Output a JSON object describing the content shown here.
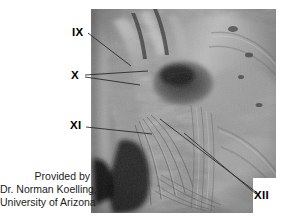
{
  "figure": {
    "type": "anatomical-dissection-photograph",
    "photo": {
      "tone": "grayscale",
      "left": 91,
      "top": 9,
      "width": 185,
      "height": 204
    }
  },
  "labels": [
    {
      "id": "ix",
      "text": "IX",
      "x": 72,
      "y": 27,
      "leaders": [
        [
          88,
          33,
          131,
          66
        ]
      ]
    },
    {
      "id": "x",
      "text": "X",
      "x": 71,
      "y": 70,
      "leaders": [
        [
          85,
          76,
          148,
          71
        ],
        [
          85,
          77,
          140,
          84
        ]
      ]
    },
    {
      "id": "xi",
      "text": "XI",
      "x": 70,
      "y": 120,
      "leaders": [
        [
          86,
          127,
          152,
          134
        ]
      ]
    },
    {
      "id": "xii",
      "text": "XII",
      "x": 254,
      "y": 190,
      "leaders": [
        [
          160,
          119,
          256,
          192
        ],
        [
          184,
          133,
          256,
          194
        ]
      ]
    }
  ],
  "caption": {
    "line1": "Provided by",
    "line2": "Dr. Norman Koelling,",
    "line3": "University of Arizona"
  },
  "colors": {
    "background": "#ffffff",
    "text": "#000000",
    "caption_text": "#1c1c1c",
    "leader_line": "#2b2b2b"
  }
}
